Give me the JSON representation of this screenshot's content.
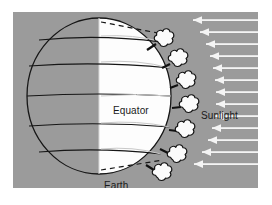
{
  "figure": {
    "title_text": null,
    "background_color": "#ffffff",
    "panel_color": "#9b9b9b",
    "lit_color": "#fdfdfd",
    "ink_color": "#1a1a1a",
    "arrow_color": "#f2f2f2"
  },
  "labels": {
    "equator": "Equator",
    "sunlight": "Sunlight",
    "earth": "Earth"
  },
  "diagram": {
    "sphere": {
      "center_x": 86,
      "center_y": 84,
      "radius_x": 72,
      "radius_y": 78,
      "terminator_x": 86,
      "latitude_line_count": 6
    },
    "clouds": {
      "count": 7,
      "positions": [
        {
          "x": 150,
          "y": 32
        },
        {
          "x": 164,
          "y": 51
        },
        {
          "x": 172,
          "y": 72
        },
        {
          "x": 176,
          "y": 97
        },
        {
          "x": 172,
          "y": 120
        },
        {
          "x": 163,
          "y": 143
        },
        {
          "x": 148,
          "y": 162
        }
      ],
      "glyph": "cloud-puff"
    },
    "sunlight_rays": {
      "count": 13,
      "direction": "right-to-left",
      "arrow_glyph": "triangle-left"
    }
  },
  "icons": {
    "cloud": "cloud-icon",
    "arrow": "arrow-left-icon",
    "globe": "globe-icon"
  }
}
